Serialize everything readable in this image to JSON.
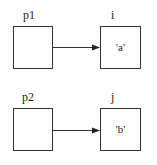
{
  "diagram": {
    "rows": [
      {
        "pointer": {
          "label": "p1",
          "value": ""
        },
        "target": {
          "label": "i",
          "value": "'a'"
        }
      },
      {
        "pointer": {
          "label": "p2",
          "value": ""
        },
        "target": {
          "label": "j",
          "value": "'b'"
        }
      }
    ],
    "colors": {
      "stroke": "#333333",
      "background": "#ffffff"
    }
  }
}
